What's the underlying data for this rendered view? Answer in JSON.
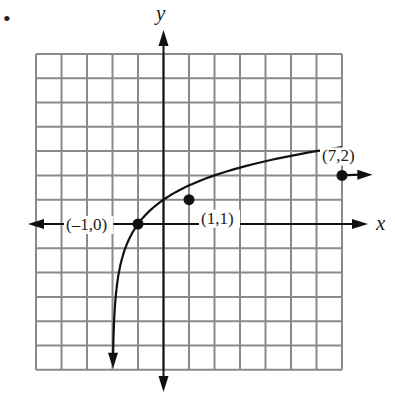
{
  "chart_data": {
    "type": "line",
    "function": "y = log2(x + 2)",
    "grid": {
      "x_range": [
        -5,
        7
      ],
      "y_range": [
        -6,
        7
      ],
      "visible": true
    },
    "xlabel": "x",
    "ylabel": "y",
    "points": [
      {
        "x": -1,
        "y": 0,
        "label": "(–1,0)"
      },
      {
        "x": 1,
        "y": 1,
        "label": "(1,1)"
      },
      {
        "x": 7,
        "y": 2,
        "label": "(7,2)"
      }
    ],
    "bullet": "•"
  },
  "colors": {
    "grid": "#8a8a8a",
    "ink": "#111111"
  }
}
